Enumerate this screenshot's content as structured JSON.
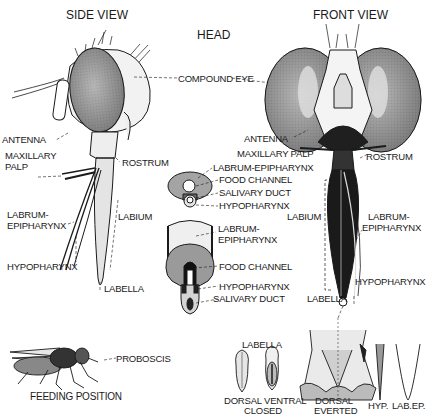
{
  "titles": {
    "side_view": "SIDE VIEW",
    "head": "HEAD",
    "front_view": "FRONT VIEW"
  },
  "side_view_labels": {
    "antenna": "ANTENNA",
    "maxillary_palp_1": "MAXILLARY",
    "maxillary_palp_2": "PALP",
    "rostrum": "ROSTRUM",
    "labrum_1": "LABRUM-",
    "labrum_2": "EPIPHARYNX",
    "labium": "LABIUM",
    "hypopharynx": "HYPOPHARYNX",
    "labella": "LABELLA"
  },
  "center_labels": {
    "compound_eye": "COMPOUND EYE",
    "cross_section": {
      "labrum": "LABRUM-EPIPHARYNX",
      "food_channel": "FOOD CHANNEL",
      "salivary_duct": "SALIVARY DUCT",
      "hypopharynx": "HYPOPHARYNX"
    },
    "longitudinal": {
      "labrum_1": "LABRUM-",
      "labrum_2": "EPIPHARYNX",
      "food_channel": "FOOD CHANNEL",
      "hypopharynx": "HYPOPHARYNX",
      "salivary_duct": "SALIVARY DUCT"
    }
  },
  "front_view_labels": {
    "antenna": "ANTENNA",
    "maxillary_palp": "MAXILLARY PALP",
    "rostrum": "ROSTRUM",
    "labium": "LABIUM",
    "labrum_1": "LABRUM-",
    "labrum_2": "EPIPHARYNX",
    "hypopharynx": "HYPOPHARYNX",
    "labella": "LABELLA"
  },
  "bottom": {
    "proboscis": "PROBOSCIS",
    "feeding_position": "FEEDING POSITION",
    "labella_title": "LABELLA",
    "dorsal_1": "DORSAL",
    "ventral": "VENTRAL",
    "closed": "CLOSED",
    "dorsal_2": "DORSAL",
    "everted": "EVERTED",
    "hyp": "HYP.",
    "labep": "LAB.EP."
  },
  "colors": {
    "ink": "#1a1a1a",
    "eye_fill": "#8a8a8a",
    "light_fill": "#d8d8d8",
    "dark_fill": "#222222"
  }
}
